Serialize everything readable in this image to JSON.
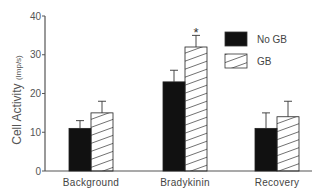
{
  "chart_data": {
    "type": "bar",
    "title": "",
    "xlabel": "",
    "ylabel": "Cell Activity",
    "ylabel_unit": "(Imp/s)",
    "ylim": [
      0,
      40
    ],
    "yticks": [
      0,
      10,
      20,
      30,
      40
    ],
    "categories": [
      "Background",
      "Bradykinin",
      "Recovery"
    ],
    "series": [
      {
        "name": "No GB",
        "fill": "solid",
        "color": "#111111",
        "values": [
          11,
          23,
          11
        ],
        "error": [
          2,
          3,
          4
        ]
      },
      {
        "name": "GB",
        "fill": "hatched",
        "color": "#ffffff",
        "values": [
          15,
          32,
          14
        ],
        "error": [
          3,
          3,
          4
        ]
      }
    ],
    "annotations": [
      {
        "text": "*",
        "category": "Bradykinin",
        "series": "GB"
      }
    ],
    "legend_position": "upper-right",
    "grid": false
  },
  "axis": {
    "ytick_labels": [
      "0",
      "10",
      "20",
      "30",
      "40"
    ],
    "ylabel_main": "Cell Activity",
    "ylabel_unit": "(Imp/s)"
  },
  "legend": {
    "items": [
      {
        "label": "No GB"
      },
      {
        "label": "GB"
      }
    ]
  },
  "annotation_text": "*"
}
